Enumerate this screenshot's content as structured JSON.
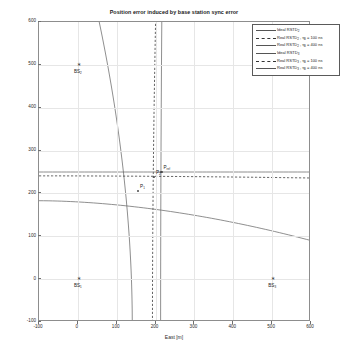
{
  "chart_data": {
    "type": "line",
    "title": "Position error induced by base station sync error",
    "xlabel": "East [m]",
    "ylabel": "North [m]",
    "xlim": [
      -100,
      600
    ],
    "ylim": [
      -100,
      600
    ],
    "xticks": [
      "-100",
      "0",
      "100",
      "200",
      "300",
      "400",
      "500",
      "600"
    ],
    "yticks": [
      "-100",
      "0",
      "100",
      "200",
      "300",
      "400",
      "500",
      "600"
    ],
    "grid": true,
    "legend_position": "top-right",
    "legend": [
      {
        "label": "Ideal RSTD",
        "sub": "2",
        "tau": "",
        "style": "solid"
      },
      {
        "label": "Real RSTD",
        "sub": "2",
        "tau": " , τ",
        "tau_sub": "B",
        "tau_val": " = 100 ns",
        "style": "dash"
      },
      {
        "label": "Real RSTD",
        "sub": "2",
        "tau": " , τ",
        "tau_sub": "B",
        "tau_val": " = 400 ns",
        "style": "solid"
      },
      {
        "label": "Ideal RSTD",
        "sub": "3",
        "tau": "",
        "style": "solid"
      },
      {
        "label": "Real RSTD",
        "sub": "3",
        "tau": " , τ",
        "tau_sub": "B",
        "tau_val": " = 100 ns",
        "style": "dash"
      },
      {
        "label": "Real RSTD",
        "sub": "3",
        "tau": " , τ",
        "tau_sub": "B",
        "tau_val": " = 400 ns",
        "style": "solid"
      }
    ],
    "base_stations": [
      {
        "name": "BS",
        "sub": "1",
        "east": 0,
        "north": 0
      },
      {
        "name": "BS",
        "sub": "2",
        "east": 0,
        "north": 500
      },
      {
        "name": "BS",
        "sub": "3",
        "east": 500,
        "north": 0
      }
    ],
    "points": [
      {
        "name": "P",
        "sub": "ref",
        "east": 215,
        "north": 250
      },
      {
        "name": "P",
        "sub": "1",
        "east": 155,
        "north": 205
      },
      {
        "name": "P",
        "sub": "2",
        "east": 196,
        "north": 238
      }
    ],
    "series": [
      {
        "name": "Ideal RSTD2",
        "style": "solid",
        "orientation": "vertical",
        "x_at_ymin": 213,
        "x_at_ymax": 216
      },
      {
        "name": "Real RSTD2 tauB=100ns",
        "style": "dash",
        "orientation": "vertical",
        "x_at_ymin": 192,
        "x_at_ymax": 200
      },
      {
        "name": "Real RSTD2 tauB=400ns",
        "style": "solid",
        "orientation": "vertical",
        "x_at_ymin": 140,
        "x_at_ymax": 55
      },
      {
        "name": "Ideal RSTD3",
        "style": "solid",
        "orientation": "horizontal",
        "y_at_xmin": 250,
        "y_at_xmax": 250
      },
      {
        "name": "Real RSTD3 tauB=100ns",
        "style": "dash",
        "orientation": "horizontal",
        "y_at_xmin": 241,
        "y_at_xmax": 236
      },
      {
        "name": "Real RSTD3 tauB=400ns",
        "style": "solid",
        "orientation": "horizontal",
        "y_at_xmin": 183,
        "y_at_xmax": 90
      }
    ]
  }
}
